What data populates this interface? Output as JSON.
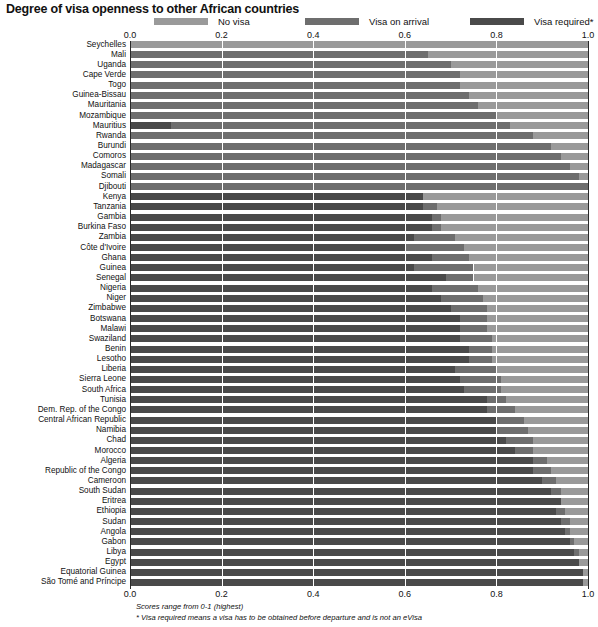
{
  "title": "Degree of visa openness to other African countries",
  "legend": {
    "position": "top",
    "items": [
      {
        "label": "No visa",
        "color": "#9a9a9a",
        "key": "no_visa"
      },
      {
        "label": "Visa on arrival",
        "color": "#6e6e6e",
        "key": "visa_on_arrival"
      },
      {
        "label": "Visa required*",
        "color": "#4a4a4a",
        "key": "visa_required"
      }
    ]
  },
  "footnotes": {
    "scores": "Scores range from 0-1 (highest)",
    "visa_required": "* Visa required means a visa has to be obtained before departure and is not an eVisa"
  },
  "chart_data": {
    "type": "bar",
    "orientation": "horizontal",
    "stacked": true,
    "title": "Degree of visa openness to other African countries",
    "xlabel": "",
    "ylabel": "",
    "xlim": [
      0,
      1
    ],
    "grid": true,
    "tick_values": [
      0.0,
      0.2,
      0.4,
      0.6,
      0.8,
      1.0
    ],
    "tick_labels": [
      "0.0",
      "0.2",
      "0.4",
      "0.6",
      "0.8",
      "1.0"
    ],
    "stack_order": [
      "visa_required",
      "visa_on_arrival",
      "no_visa"
    ],
    "series": [
      {
        "name": "Visa required*",
        "key": "visa_required",
        "color": "#4a4a4a"
      },
      {
        "name": "Visa on arrival",
        "key": "visa_on_arrival",
        "color": "#6e6e6e"
      },
      {
        "name": "No visa",
        "key": "no_visa",
        "color": "#9a9a9a"
      }
    ],
    "categories": [
      "Seychelles",
      "Mali",
      "Uganda",
      "Cape Verde",
      "Togo",
      "Guinea-Bissau",
      "Mauritania",
      "Mozambique",
      "Mauritius",
      "Rwanda",
      "Burundi",
      "Comoros",
      "Madagascar",
      "Somali",
      "Djibouti",
      "Kenya",
      "Tanzania",
      "Gambia",
      "Burkina Faso",
      "Zambia",
      "Côte d'Ivoire",
      "Ghana",
      "Guinea",
      "Senegal",
      "Nigeria",
      "Niger",
      "Zimbabwe",
      "Botswana",
      "Malawi",
      "Swaziland",
      "Benin",
      "Lesotho",
      "Liberia",
      "Sierra Leone",
      "South Africa",
      "Tunisia",
      "Dem. Rep. of the Congo",
      "Central African Republic",
      "Namibia",
      "Chad",
      "Morocco",
      "Algeria",
      "Republic of the Congo",
      "Cameroon",
      "South Sudan",
      "Eritrea",
      "Ethiopia",
      "Sudan",
      "Angola",
      "Gabon",
      "Libya",
      "Egypt",
      "Equatorial Guinea",
      "São Tomé and Príncipe"
    ],
    "rows": [
      {
        "country": "Seychelles",
        "visa_required": 0.0,
        "visa_on_arrival": 0.0,
        "no_visa": 1.0
      },
      {
        "country": "Mali",
        "visa_required": 0.0,
        "visa_on_arrival": 0.65,
        "no_visa": 0.35
      },
      {
        "country": "Uganda",
        "visa_required": 0.0,
        "visa_on_arrival": 0.7,
        "no_visa": 0.3
      },
      {
        "country": "Cape Verde",
        "visa_required": 0.0,
        "visa_on_arrival": 0.72,
        "no_visa": 0.28
      },
      {
        "country": "Togo",
        "visa_required": 0.0,
        "visa_on_arrival": 0.72,
        "no_visa": 0.28
      },
      {
        "country": "Guinea-Bissau",
        "visa_required": 0.0,
        "visa_on_arrival": 0.74,
        "no_visa": 0.26
      },
      {
        "country": "Mauritania",
        "visa_required": 0.0,
        "visa_on_arrival": 0.76,
        "no_visa": 0.24
      },
      {
        "country": "Mozambique",
        "visa_required": 0.0,
        "visa_on_arrival": 0.8,
        "no_visa": 0.2
      },
      {
        "country": "Mauritius",
        "visa_required": 0.09,
        "visa_on_arrival": 0.74,
        "no_visa": 0.17
      },
      {
        "country": "Rwanda",
        "visa_required": 0.0,
        "visa_on_arrival": 0.88,
        "no_visa": 0.12
      },
      {
        "country": "Burundi",
        "visa_required": 0.0,
        "visa_on_arrival": 0.92,
        "no_visa": 0.08
      },
      {
        "country": "Comoros",
        "visa_required": 0.0,
        "visa_on_arrival": 0.94,
        "no_visa": 0.06
      },
      {
        "country": "Madagascar",
        "visa_required": 0.0,
        "visa_on_arrival": 0.96,
        "no_visa": 0.04
      },
      {
        "country": "Somali",
        "visa_required": 0.0,
        "visa_on_arrival": 0.98,
        "no_visa": 0.02
      },
      {
        "country": "Djibouti",
        "visa_required": 0.0,
        "visa_on_arrival": 1.0,
        "no_visa": 0.0
      },
      {
        "country": "Kenya",
        "visa_required": 0.64,
        "visa_on_arrival": 0.0,
        "no_visa": 0.36
      },
      {
        "country": "Tanzania",
        "visa_required": 0.64,
        "visa_on_arrival": 0.03,
        "no_visa": 0.33
      },
      {
        "country": "Gambia",
        "visa_required": 0.66,
        "visa_on_arrival": 0.02,
        "no_visa": 0.32
      },
      {
        "country": "Burkina Faso",
        "visa_required": 0.66,
        "visa_on_arrival": 0.02,
        "no_visa": 0.32
      },
      {
        "country": "Zambia",
        "visa_required": 0.62,
        "visa_on_arrival": 0.09,
        "no_visa": 0.29
      },
      {
        "country": "Côte d'Ivoire",
        "visa_required": 0.6,
        "visa_on_arrival": 0.13,
        "no_visa": 0.27
      },
      {
        "country": "Ghana",
        "visa_required": 0.66,
        "visa_on_arrival": 0.08,
        "no_visa": 0.26
      },
      {
        "country": "Guinea",
        "visa_required": 0.62,
        "visa_on_arrival": 0.13,
        "no_visa": 0.25
      },
      {
        "country": "Senegal",
        "visa_required": 0.69,
        "visa_on_arrival": 0.06,
        "no_visa": 0.25
      },
      {
        "country": "Nigeria",
        "visa_required": 0.66,
        "visa_on_arrival": 0.1,
        "no_visa": 0.24
      },
      {
        "country": "Niger",
        "visa_required": 0.68,
        "visa_on_arrival": 0.09,
        "no_visa": 0.23
      },
      {
        "country": "Zimbabwe",
        "visa_required": 0.7,
        "visa_on_arrival": 0.08,
        "no_visa": 0.22
      },
      {
        "country": "Botswana",
        "visa_required": 0.72,
        "visa_on_arrival": 0.06,
        "no_visa": 0.22
      },
      {
        "country": "Malawi",
        "visa_required": 0.72,
        "visa_on_arrival": 0.06,
        "no_visa": 0.22
      },
      {
        "country": "Swaziland",
        "visa_required": 0.72,
        "visa_on_arrival": 0.07,
        "no_visa": 0.21
      },
      {
        "country": "Benin",
        "visa_required": 0.74,
        "visa_on_arrival": 0.05,
        "no_visa": 0.21
      },
      {
        "country": "Lesotho",
        "visa_required": 0.74,
        "visa_on_arrival": 0.05,
        "no_visa": 0.21
      },
      {
        "country": "Liberia",
        "visa_required": 0.71,
        "visa_on_arrival": 0.09,
        "no_visa": 0.2
      },
      {
        "country": "Sierra Leone",
        "visa_required": 0.72,
        "visa_on_arrival": 0.09,
        "no_visa": 0.19
      },
      {
        "country": "South Africa",
        "visa_required": 0.73,
        "visa_on_arrival": 0.08,
        "no_visa": 0.19
      },
      {
        "country": "Tunisia",
        "visa_required": 0.78,
        "visa_on_arrival": 0.04,
        "no_visa": 0.18
      },
      {
        "country": "Dem. Rep. of the Congo",
        "visa_required": 0.78,
        "visa_on_arrival": 0.06,
        "no_visa": 0.16
      },
      {
        "country": "Central African Republic",
        "visa_required": 0.8,
        "visa_on_arrival": 0.06,
        "no_visa": 0.14
      },
      {
        "country": "Namibia",
        "visa_required": 0.8,
        "visa_on_arrival": 0.07,
        "no_visa": 0.13
      },
      {
        "country": "Chad",
        "visa_required": 0.82,
        "visa_on_arrival": 0.06,
        "no_visa": 0.12
      },
      {
        "country": "Morocco",
        "visa_required": 0.84,
        "visa_on_arrival": 0.04,
        "no_visa": 0.12
      },
      {
        "country": "Algeria",
        "visa_required": 0.88,
        "visa_on_arrival": 0.03,
        "no_visa": 0.09
      },
      {
        "country": "Republic of the Congo",
        "visa_required": 0.88,
        "visa_on_arrival": 0.04,
        "no_visa": 0.08
      },
      {
        "country": "Cameroon",
        "visa_required": 0.9,
        "visa_on_arrival": 0.03,
        "no_visa": 0.07
      },
      {
        "country": "South Sudan",
        "visa_required": 0.92,
        "visa_on_arrival": 0.02,
        "no_visa": 0.06
      },
      {
        "country": "Eritrea",
        "visa_required": 0.94,
        "visa_on_arrival": 0.0,
        "no_visa": 0.06
      },
      {
        "country": "Ethiopia",
        "visa_required": 0.93,
        "visa_on_arrival": 0.02,
        "no_visa": 0.05
      },
      {
        "country": "Sudan",
        "visa_required": 0.94,
        "visa_on_arrival": 0.02,
        "no_visa": 0.04
      },
      {
        "country": "Angola",
        "visa_required": 0.95,
        "visa_on_arrival": 0.01,
        "no_visa": 0.04
      },
      {
        "country": "Gabon",
        "visa_required": 0.96,
        "visa_on_arrival": 0.01,
        "no_visa": 0.03
      },
      {
        "country": "Libya",
        "visa_required": 0.97,
        "visa_on_arrival": 0.01,
        "no_visa": 0.02
      },
      {
        "country": "Egypt",
        "visa_required": 0.98,
        "visa_on_arrival": 0.0,
        "no_visa": 0.02
      },
      {
        "country": "Equatorial Guinea",
        "visa_required": 0.99,
        "visa_on_arrival": 0.0,
        "no_visa": 0.01
      },
      {
        "country": "São Tomé and Príncipe",
        "visa_required": 0.99,
        "visa_on_arrival": 0.0,
        "no_visa": 0.01
      }
    ]
  }
}
